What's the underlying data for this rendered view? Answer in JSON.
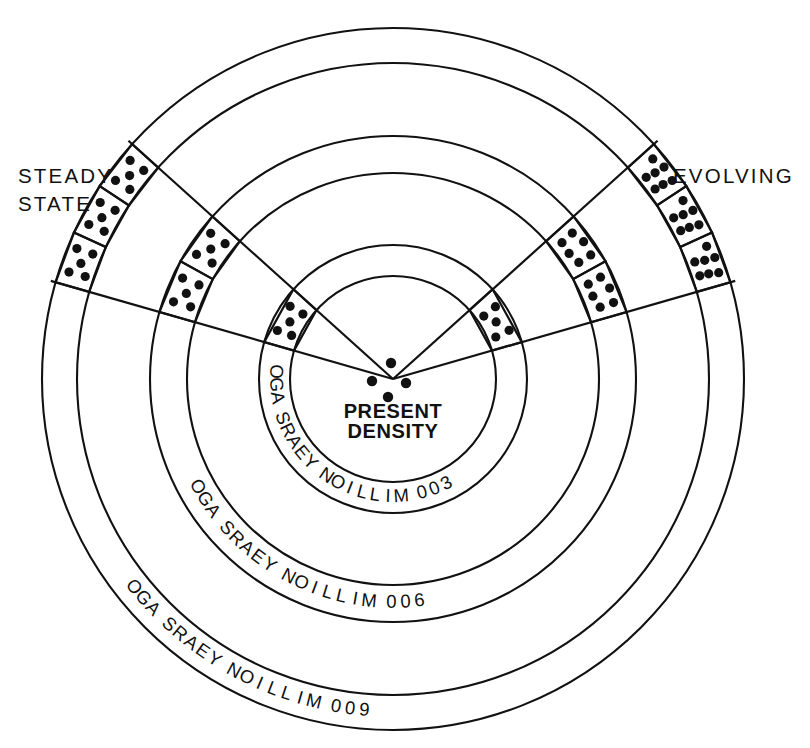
{
  "figure": {
    "title_visible": false,
    "background_color": "#ffffff",
    "ink_color": "#111111"
  },
  "labels": {
    "left_label_line1": "STEADY",
    "left_label_line2": "STATE",
    "right_label": "EVOLVING",
    "center_line1": "PRESENT",
    "center_line2": "DENSITY"
  },
  "ring_labels": [
    {
      "id": "ring-300",
      "text": "300 MILLION YEARS AGO"
    },
    {
      "id": "ring-600",
      "text": "600 MILLION YEARS AGO"
    },
    {
      "id": "ring-900",
      "text": "900 MILLION YEARS AGO"
    }
  ],
  "chart_data": {
    "type": "diagram",
    "subtype": "radial-wedge-density-comparison",
    "center": {
      "x": 393,
      "y": 379
    },
    "rings": [
      {
        "index": 0,
        "radius": 103,
        "label": "",
        "pair": "inner-a"
      },
      {
        "index": 1,
        "radius": 134,
        "label": "300 MILLION YEARS AGO",
        "pair": "inner-b"
      },
      {
        "index": 2,
        "radius": 206,
        "label": "",
        "pair": "mid-a"
      },
      {
        "index": 3,
        "radius": 243,
        "label": "600 MILLION YEARS AGO",
        "pair": "mid-b"
      },
      {
        "index": 4,
        "radius": 316,
        "label": "",
        "pair": "outer-a"
      },
      {
        "index": 5,
        "radius": 351,
        "label": "900 MILLION YEARS AGO",
        "pair": "outer-b"
      }
    ],
    "wedges": [
      {
        "name": "steady-state",
        "side": "left",
        "label": "STEADY STATE",
        "angle_start_deg": 138,
        "angle_end_deg": 164,
        "bands": [
          {
            "band": "inner",
            "r_inner": 103,
            "r_outer": 134,
            "cells": 1,
            "dots_per_cell": 5
          },
          {
            "band": "middle",
            "r_inner": 206,
            "r_outer": 243,
            "cells": 2,
            "dots_per_cell": 5
          },
          {
            "band": "outer",
            "r_inner": 316,
            "r_outer": 351,
            "cells": 3,
            "dots_per_cell": 5
          }
        ],
        "interpretation": "density of galaxies stays constant looking back in time"
      },
      {
        "name": "evolving",
        "side": "right",
        "label": "EVOLVING",
        "angle_start_deg": 16,
        "angle_end_deg": 42,
        "bands": [
          {
            "band": "inner",
            "r_inner": 103,
            "r_outer": 134,
            "cells": 1,
            "dots_per_cell": 5
          },
          {
            "band": "middle",
            "r_inner": 206,
            "r_outer": 243,
            "cells": 2,
            "dots_per_cell": 6
          },
          {
            "band": "outer",
            "r_inner": 316,
            "r_outer": 351,
            "cells": 3,
            "dots_per_cell": 7
          }
        ],
        "interpretation": "density of galaxies increases looking back in time"
      }
    ],
    "center_dots": [
      {
        "x": 391,
        "y": 363
      },
      {
        "x": 372,
        "y": 381
      },
      {
        "x": 406,
        "y": 383
      },
      {
        "x": 388,
        "y": 397
      }
    ]
  }
}
